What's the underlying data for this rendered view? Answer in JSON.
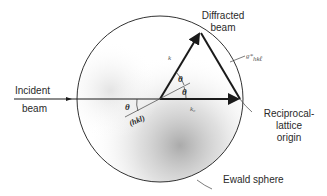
{
  "diagram": {
    "labels": {
      "diffracted_beam_line1": "Diffracted",
      "diffracted_beam_line2": "beam",
      "incident_beam_line1": "Incident",
      "incident_beam_line2": "beam",
      "reciprocal_line1": "Reciprocal-",
      "reciprocal_line2": "lattice",
      "reciprocal_line3": "origin",
      "ewald_sphere": "Ewald sphere",
      "theta_upper": "θ",
      "theta_lower": "θ",
      "theta_plane": "θ",
      "plane": "(hkl)",
      "k_vector": "k",
      "k0_vector": "k₀",
      "g_vector": "g*",
      "g_subscript": "hkℓ"
    },
    "geometry": {
      "circle_center": [
        160,
        99
      ],
      "circle_radius": 83,
      "apex": [
        200,
        32
      ],
      "reciprocal_origin": [
        240,
        99
      ]
    },
    "colors": {
      "line": "#1a1a1a",
      "circle": "#333333",
      "shade": "#9a9a9a"
    }
  }
}
